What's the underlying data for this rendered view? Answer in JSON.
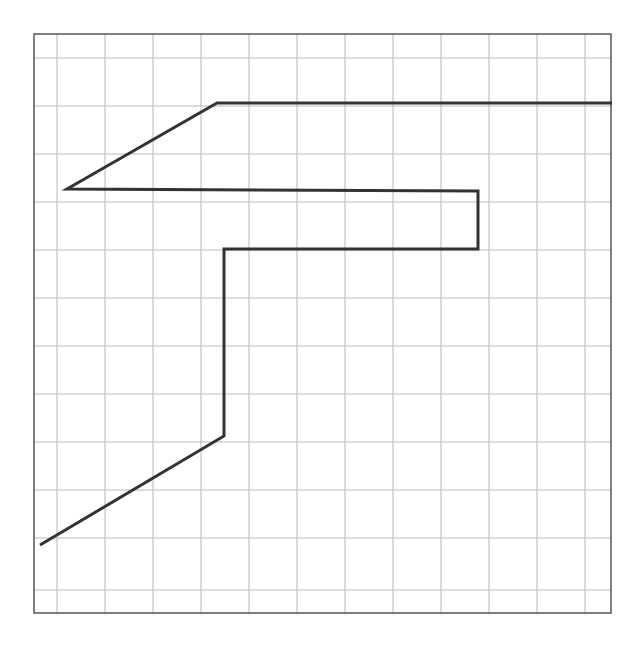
{
  "diagram": {
    "type": "grid-path-drawing",
    "colors": {
      "background": "#ffffff",
      "grid": "#b8b8b8",
      "frame": "#555555",
      "path": "#333333"
    },
    "frame": {
      "x1": 34,
      "y1": 34,
      "x2": 611,
      "y2": 613
    },
    "grid": {
      "vertical_lines": [
        57,
        105,
        153,
        201,
        249,
        297,
        345,
        393,
        441,
        489,
        537,
        585
      ],
      "horizontal_lines": [
        58,
        106,
        154,
        202,
        250,
        298,
        346,
        394,
        442,
        490,
        538,
        590
      ]
    },
    "path": {
      "stroke_width": 3,
      "points": [
        [
          40,
          545
        ],
        [
          224,
          436
        ],
        [
          224,
          249
        ],
        [
          478,
          249
        ],
        [
          478,
          191
        ],
        [
          67,
          189
        ],
        [
          217,
          103
        ],
        [
          612,
          103
        ]
      ]
    }
  }
}
